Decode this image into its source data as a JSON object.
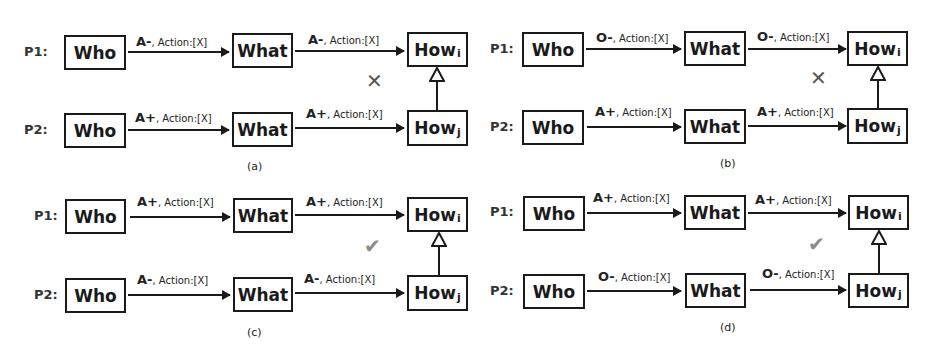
{
  "figure": {
    "panels": [
      {
        "id": "a",
        "caption": "(a)",
        "result": "invalid",
        "mark_icon": "cross",
        "rows": [
          {
            "label": "P1:",
            "who": "Who",
            "what": "What",
            "how": "How",
            "how_sub": "i",
            "edge1": {
              "polarity": "A-",
              "action": ", Action:[X]"
            },
            "edge2": {
              "polarity": "A-",
              "action": ", Action:[X]"
            }
          },
          {
            "label": "P2:",
            "who": "Who",
            "what": "What",
            "how": "How",
            "how_sub": "j",
            "edge1": {
              "polarity": "A+",
              "action": ", Action:[X]"
            },
            "edge2": {
              "polarity": "A+",
              "action": ", Action:[X]"
            }
          }
        ]
      },
      {
        "id": "b",
        "caption": "(b)",
        "result": "invalid",
        "mark_icon": "cross",
        "rows": [
          {
            "label": "P1:",
            "who": "Who",
            "what": "What",
            "how": "How",
            "how_sub": "i",
            "edge1": {
              "polarity": "O-",
              "action": ", Action:[X]"
            },
            "edge2": {
              "polarity": "O-",
              "action": ", Action:[X]"
            }
          },
          {
            "label": "P2:",
            "who": "Who",
            "what": "What",
            "how": "How",
            "how_sub": "j",
            "edge1": {
              "polarity": "A+",
              "action": ", Action:[X]"
            },
            "edge2": {
              "polarity": "A+",
              "action": ", Action:[X]"
            }
          }
        ]
      },
      {
        "id": "c",
        "caption": "(c)",
        "result": "valid",
        "mark_icon": "check",
        "rows": [
          {
            "label": "P1:",
            "who": "Who",
            "what": "What",
            "how": "How",
            "how_sub": "i",
            "edge1": {
              "polarity": "A+",
              "action": ", Action:[X]"
            },
            "edge2": {
              "polarity": "A+",
              "action": ", Action:[X]"
            }
          },
          {
            "label": "P2:",
            "who": "Who",
            "what": "What",
            "how": "How",
            "how_sub": "j",
            "edge1": {
              "polarity": "A-",
              "action": ", Action:[X]"
            },
            "edge2": {
              "polarity": "A-",
              "action": ", Action:[X]"
            }
          }
        ]
      },
      {
        "id": "d",
        "caption": "(d)",
        "result": "valid",
        "mark_icon": "check",
        "rows": [
          {
            "label": "P1:",
            "who": "Who",
            "what": "What",
            "how": "How",
            "how_sub": "i",
            "edge1": {
              "polarity": "A+",
              "action": ", Action:[X]"
            },
            "edge2": {
              "polarity": "A+",
              "action": ", Action:[X]"
            }
          },
          {
            "label": "P2:",
            "who": "Who",
            "what": "What",
            "how": "How",
            "how_sub": "j",
            "edge1": {
              "polarity": "O-",
              "action": ", Action:[X]"
            },
            "edge2": {
              "polarity": "O-",
              "action": ", Action:[X]"
            }
          }
        ]
      }
    ],
    "marks": {
      "cross": "✕",
      "check": "✔"
    },
    "colors": {
      "stroke": "#1a1a1a",
      "cross": "#555555",
      "check": "#8a8a8a"
    }
  }
}
